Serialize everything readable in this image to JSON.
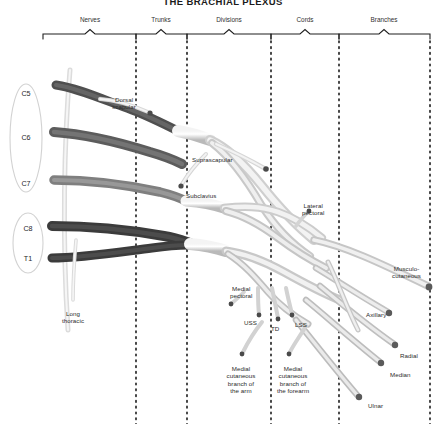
{
  "title": "THE BRACHIAL PLEXUS",
  "colors": {
    "background": "#ffffff",
    "nerve_light": "#d7d7d7",
    "nerve_mid": "#8f8f8f",
    "nerve_dark": "#4a4a4a",
    "outline": "#9a9a9a",
    "text": "#2b2b2b",
    "divider": "#1a1a1a"
  },
  "sections": [
    {
      "label": "Nerves",
      "x": 90,
      "y": 16,
      "bracket_start": 43,
      "bracket_end": 136
    },
    {
      "label": "Trunks",
      "x": 161,
      "y": 16,
      "bracket_start": 136,
      "bracket_end": 187
    },
    {
      "label": "Divisions",
      "x": 229,
      "y": 16,
      "bracket_start": 187,
      "bracket_end": 271
    },
    {
      "label": "Cords",
      "x": 305,
      "y": 16,
      "bracket_start": 271,
      "bracket_end": 339
    },
    {
      "label": "Branches",
      "x": 384,
      "y": 16,
      "bracket_start": 339,
      "bracket_end": 430
    }
  ],
  "dividers": [
    136,
    187,
    271,
    339,
    430
  ],
  "roots": [
    {
      "label": "C5",
      "x": 26,
      "y": 93
    },
    {
      "label": "C6",
      "x": 26,
      "y": 137
    },
    {
      "label": "C7",
      "x": 26,
      "y": 183
    },
    {
      "label": "C8",
      "x": 28,
      "y": 228
    },
    {
      "label": "T1",
      "x": 28,
      "y": 258
    }
  ],
  "branch_labels": [
    {
      "name": "dorsal-scapular",
      "text": "Dorsal\nscapular",
      "x": 124,
      "y": 96,
      "align": "center"
    },
    {
      "name": "suprascapular",
      "text": "Suprascapular",
      "x": 192,
      "y": 156,
      "align": "left"
    },
    {
      "name": "subclavius",
      "text": "Subclavius",
      "x": 186,
      "y": 192,
      "align": "left"
    },
    {
      "name": "lateral-pectoral",
      "text": "Lateral\npectoral",
      "x": 302,
      "y": 202,
      "align": "left"
    },
    {
      "name": "musculocutaneous",
      "text": "Musculo-\ncutaneous",
      "x": 392,
      "y": 265,
      "align": "left"
    },
    {
      "name": "medial-pectoral",
      "text": "Medial\npectoral",
      "x": 230,
      "y": 285,
      "align": "left"
    },
    {
      "name": "uss",
      "text": "USS",
      "x": 244,
      "y": 319,
      "align": "left"
    },
    {
      "name": "td",
      "text": "TD",
      "x": 271,
      "y": 325,
      "align": "left"
    },
    {
      "name": "lss",
      "text": "LSS",
      "x": 295,
      "y": 321,
      "align": "left"
    },
    {
      "name": "axillary",
      "text": "Axillary",
      "x": 366,
      "y": 311,
      "align": "left"
    },
    {
      "name": "radial",
      "text": "Radial",
      "x": 400,
      "y": 352,
      "align": "left"
    },
    {
      "name": "median",
      "text": "Median",
      "x": 390,
      "y": 371,
      "align": "left"
    },
    {
      "name": "ulnar",
      "text": "Ulnar",
      "x": 368,
      "y": 402,
      "align": "left"
    },
    {
      "name": "long-thoracic",
      "text": "Long\nthoracic",
      "x": 73,
      "y": 310,
      "align": "center"
    },
    {
      "name": "medial-cutaneous-arm",
      "text": "Medial\ncutaneous\nbranch of\nthe arm",
      "x": 241,
      "y": 365,
      "align": "center"
    },
    {
      "name": "medial-cutaneous-fore",
      "text": "Medial\ncutaneous\nbranch of\nthe forearm",
      "x": 293,
      "y": 365,
      "align": "center"
    }
  ]
}
